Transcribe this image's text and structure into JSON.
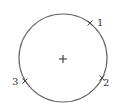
{
  "diagram": {
    "type": "circle-with-points",
    "circle": {
      "cx": 63,
      "cy": 58,
      "r": 44,
      "stroke": "#6a6a6a"
    },
    "center_mark": {
      "x": 63,
      "y": 59,
      "symbol": "+"
    },
    "points": [
      {
        "label": "1",
        "x": 90,
        "y": 23,
        "label_x": 97,
        "label_y": 26
      },
      {
        "label": "2",
        "x": 102,
        "y": 78,
        "label_x": 103,
        "label_y": 86
      },
      {
        "label": "3",
        "x": 25,
        "y": 81,
        "label_x": 12,
        "label_y": 85
      }
    ]
  }
}
